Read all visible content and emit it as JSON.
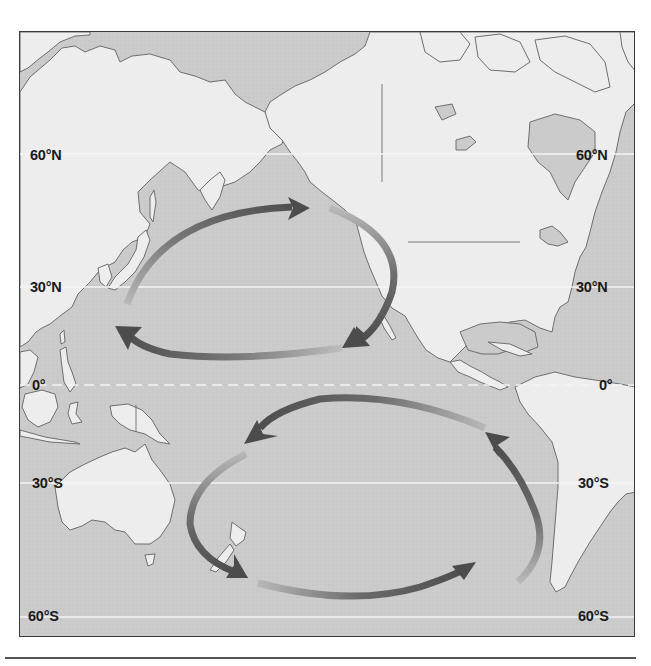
{
  "map": {
    "title": "",
    "region": "Pacific Ocean",
    "colors": {
      "ocean": "#cbcbcb",
      "land": "#ededed",
      "coastline": "#6e6e6e",
      "frame": "#3a3a3a",
      "lat_line": "#f4f4f4",
      "arrow_dark": "#5a5a5a",
      "arrow_light": "#b4b4b4",
      "label": "#1a1a1a"
    },
    "latitude_lines": [
      {
        "label": "60°N",
        "y": 122,
        "style": "solid"
      },
      {
        "label": "30°N",
        "y": 255,
        "style": "solid"
      },
      {
        "label": "0°",
        "y": 353,
        "style": "dashed"
      },
      {
        "label": "30°S",
        "y": 451,
        "style": "solid"
      },
      {
        "label": "60°S",
        "y": 585,
        "style": "solid"
      }
    ],
    "labels_left": {
      "lat_60n": "60°N",
      "lat_30n": "30°N",
      "lat_0": "0°",
      "lat_30s": "30°S",
      "lat_60s": "60°S"
    },
    "labels_right": {
      "lat_60n": "60°N",
      "lat_30n": "30°N",
      "lat_0": "0°",
      "lat_30s": "30°S",
      "lat_60s": "60°S"
    },
    "gyres": [
      {
        "name": "North Pacific Gyre",
        "direction": "clockwise",
        "segments": 3
      },
      {
        "name": "South Pacific Gyre",
        "direction": "counterclockwise",
        "segments": 4
      }
    ],
    "landmasses": [
      "Asia",
      "North America",
      "Central America",
      "South America",
      "Australia",
      "New Zealand",
      "Indonesia",
      "Papua New Guinea",
      "Japan",
      "Kamchatka"
    ]
  }
}
